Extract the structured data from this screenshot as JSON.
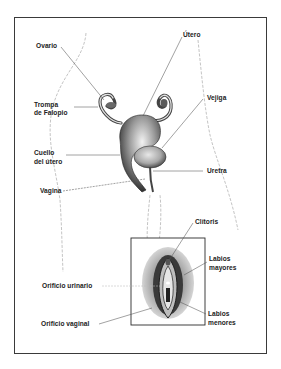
{
  "diagram": {
    "type": "anatomical-illustration",
    "language": "es",
    "labels": {
      "ovario": "Ovario",
      "utero": "Útero",
      "trompa_line1": "Trompa",
      "trompa_line2": "de Falopio",
      "vejiga": "Vejiga",
      "cuello_line1": "Cuello",
      "cuello_line2": "del útero",
      "uretra": "Uretra",
      "vagina": "Vagina",
      "clitoris": "Clítoris",
      "labios_mayores_line1": "Labios",
      "labios_mayores_line2": "mayores",
      "orificio_urinario": "Orificio urinario",
      "orificio_vaginal": "Orificio vaginal",
      "labios_menores_line1": "Labios",
      "labios_menores_line2": "menores"
    },
    "colors": {
      "border": "#3a3a3a",
      "leader_line": "#555555",
      "body_outline": "#b8b8b8",
      "organ_dark": "#2a2a2a",
      "organ_mid": "#7a7a7a",
      "organ_light": "#d6d6d6"
    }
  }
}
